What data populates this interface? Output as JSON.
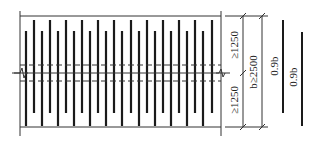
{
  "diagram": {
    "type": "rebar-splice-layout",
    "bar_count_in_panel": 20,
    "colors": {
      "line": "#222222",
      "bar": "#1a1a1a",
      "dash": "#333333",
      "background": "#ffffff"
    },
    "labels": {
      "upper_segment": "≥1250",
      "lower_segment": "≥1250",
      "total_width": "b≥2500",
      "bar_length_1": "0.9b",
      "bar_length_2": "0.9b"
    },
    "symbols": {
      "break_mark": "break-line-icon"
    }
  }
}
